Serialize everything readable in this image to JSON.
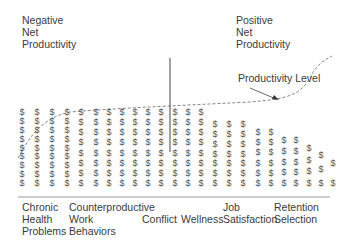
{
  "labels": {
    "negative": "Negative\nNet\nProductivity",
    "positive": "Positive\nNet\nProductivity",
    "productivity_level": "Productivity Level"
  },
  "categories": [
    {
      "label": "Chronic\nHealth\nProblems",
      "x": 22
    },
    {
      "label": "Counterproductive\nWork\nBehaviors",
      "x": 69
    },
    {
      "label": "Conflict",
      "x": 142
    },
    {
      "label": "Wellness",
      "x": 181
    },
    {
      "label": "Job\nSatisfaction",
      "x": 223
    },
    {
      "label": "Retention\nSelection",
      "x": 274
    }
  ],
  "symbol": "$",
  "columns": [
    {
      "x": 22,
      "count": 9,
      "top": 112
    },
    {
      "x": 37,
      "count": 9,
      "top": 112
    },
    {
      "x": 52,
      "count": 9,
      "top": 112
    },
    {
      "x": 67,
      "count": 9,
      "top": 112
    },
    {
      "x": 81,
      "count": 8,
      "top": 112
    },
    {
      "x": 96,
      "count": 8,
      "top": 112
    },
    {
      "x": 109,
      "count": 8,
      "top": 112
    },
    {
      "x": 122,
      "count": 8,
      "top": 112
    },
    {
      "x": 135,
      "count": 8,
      "top": 112
    },
    {
      "x": 148,
      "count": 8,
      "top": 112
    },
    {
      "x": 161,
      "count": 8,
      "top": 112
    },
    {
      "x": 175,
      "count": 8,
      "top": 112
    },
    {
      "x": 188,
      "count": 8,
      "top": 112
    },
    {
      "x": 201,
      "count": 8,
      "top": 112
    },
    {
      "x": 215,
      "count": 7,
      "top": 124
    },
    {
      "x": 229,
      "count": 7,
      "top": 124
    },
    {
      "x": 243,
      "count": 7,
      "top": 124
    },
    {
      "x": 258,
      "count": 6,
      "top": 132
    },
    {
      "x": 271,
      "count": 6,
      "top": 132
    },
    {
      "x": 284,
      "count": 5,
      "top": 140
    },
    {
      "x": 296,
      "count": 5,
      "top": 140
    },
    {
      "x": 309,
      "count": 4,
      "top": 148
    },
    {
      "x": 321,
      "count": 3,
      "top": 155
    },
    {
      "x": 333,
      "count": 2,
      "top": 163
    }
  ],
  "colors": {
    "ink": "#3a3a3a",
    "symbol": "#555555",
    "line": "#555555"
  }
}
